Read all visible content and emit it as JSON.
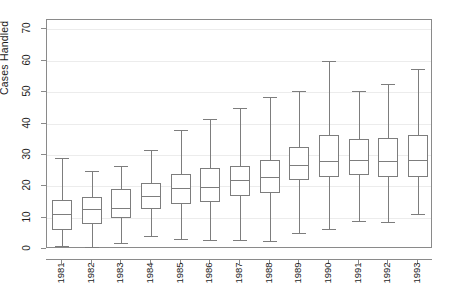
{
  "chart_data": {
    "type": "box",
    "title": "",
    "subtitle": "",
    "xlabel": "",
    "ylabel": "Cases Handled",
    "ylim": [
      0,
      73
    ],
    "yticks": [
      0,
      10,
      20,
      30,
      40,
      50,
      60,
      70
    ],
    "ytick_labels": [
      "0",
      "10",
      "20",
      "30",
      "40",
      "50",
      "60",
      "70"
    ],
    "grid": true,
    "legend": "none",
    "categories": [
      "1981",
      "1982",
      "1983",
      "1984",
      "1985",
      "1986",
      "1987",
      "1988",
      "1989",
      "1990",
      "1991",
      "1992",
      "1993"
    ],
    "boxes": [
      {
        "category": "1981",
        "whisker_low": 1.0,
        "q1": 6.2,
        "median": 11.0,
        "q3": 15.5,
        "whisker_high": 29.0
      },
      {
        "category": "1982",
        "whisker_low": 0.5,
        "q1": 8.0,
        "median": 12.8,
        "q3": 16.6,
        "whisker_high": 25.0
      },
      {
        "category": "1983",
        "whisker_low": 2.0,
        "q1": 10.0,
        "median": 13.2,
        "q3": 19.0,
        "whisker_high": 26.5
      },
      {
        "category": "1984",
        "whisker_low": 4.0,
        "q1": 12.8,
        "median": 16.8,
        "q3": 21.0,
        "whisker_high": 31.5
      },
      {
        "category": "1985",
        "whisker_low": 3.2,
        "q1": 14.5,
        "median": 19.5,
        "q3": 24.0,
        "whisker_high": 38.0
      },
      {
        "category": "1986",
        "whisker_low": 3.0,
        "q1": 15.0,
        "median": 19.8,
        "q3": 25.8,
        "whisker_high": 41.5
      },
      {
        "category": "1987",
        "whisker_low": 2.8,
        "q1": 17.0,
        "median": 22.0,
        "q3": 26.5,
        "whisker_high": 45.0
      },
      {
        "category": "1988",
        "whisker_low": 2.5,
        "q1": 18.0,
        "median": 23.0,
        "q3": 28.5,
        "whisker_high": 48.5
      },
      {
        "category": "1989",
        "whisker_low": 5.0,
        "q1": 22.0,
        "median": 26.8,
        "q3": 32.5,
        "whisker_high": 50.5
      },
      {
        "category": "1990",
        "whisker_low": 6.5,
        "q1": 23.0,
        "median": 28.0,
        "q3": 36.5,
        "whisker_high": 60.0
      },
      {
        "category": "1991",
        "whisker_low": 9.0,
        "q1": 23.5,
        "median": 28.5,
        "q3": 35.0,
        "whisker_high": 50.5
      },
      {
        "category": "1992",
        "whisker_low": 8.5,
        "q1": 23.0,
        "median": 28.0,
        "q3": 35.5,
        "whisker_high": 52.5
      },
      {
        "category": "1993",
        "whisker_low": 11.0,
        "q1": 23.0,
        "median": 28.5,
        "q3": 36.5,
        "whisker_high": 57.5
      }
    ]
  },
  "colors": {
    "line": "#7d7d7d",
    "frame": "#8a8a8a",
    "grid": "#ececec",
    "text": "#1b1b1b",
    "background": "#ffffff"
  }
}
